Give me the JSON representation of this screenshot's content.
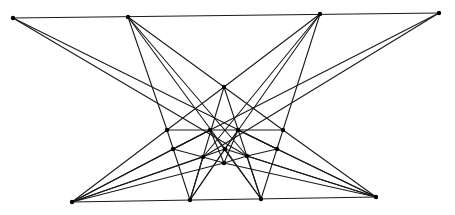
{
  "diagram": {
    "type": "line-configuration",
    "colors": {
      "line": "#1a1a1a",
      "point": "#000000",
      "background": "#ffffff"
    },
    "points": {
      "A": [
        13,
        18
      ],
      "B": [
        128,
        17
      ],
      "C": [
        320,
        14
      ],
      "D": [
        439,
        13
      ],
      "E": [
        72,
        202
      ],
      "F": [
        190,
        200
      ],
      "G": [
        261,
        199
      ],
      "H": [
        376,
        197
      ],
      "T": [
        224,
        87
      ],
      "P1": [
        167,
        130
      ],
      "P2": [
        210,
        130
      ],
      "P3": [
        238,
        130
      ],
      "P4": [
        283,
        130
      ],
      "Q1": [
        173,
        149
      ],
      "Q2": [
        225,
        149
      ],
      "Q3": [
        277,
        149
      ],
      "R1": [
        203,
        157
      ],
      "R2": [
        247,
        156
      ],
      "S": [
        224,
        163
      ]
    },
    "lines": [
      [
        "A",
        "D"
      ],
      [
        "E",
        "H"
      ],
      [
        "A",
        "R2"
      ],
      [
        "R2",
        "H"
      ],
      [
        "A",
        "Q3"
      ],
      [
        "Q3",
        "H"
      ],
      [
        "D",
        "R1"
      ],
      [
        "R1",
        "E"
      ],
      [
        "D",
        "Q1"
      ],
      [
        "Q1",
        "E"
      ],
      [
        "B",
        "P1"
      ],
      [
        "P1",
        "F"
      ],
      [
        "B",
        "Q2"
      ],
      [
        "Q2",
        "G"
      ],
      [
        "B",
        "T"
      ],
      [
        "T",
        "P4"
      ],
      [
        "P4",
        "H"
      ],
      [
        "B",
        "R2"
      ],
      [
        "R2",
        "G"
      ],
      [
        "C",
        "P4"
      ],
      [
        "P4",
        "G"
      ],
      [
        "C",
        "Q2"
      ],
      [
        "Q2",
        "F"
      ],
      [
        "C",
        "T"
      ],
      [
        "T",
        "P1"
      ],
      [
        "P1",
        "E"
      ],
      [
        "C",
        "R1"
      ],
      [
        "R1",
        "F"
      ],
      [
        "T",
        "F"
      ],
      [
        "T",
        "G"
      ],
      [
        "P1",
        "P4"
      ],
      [
        "E",
        "P2"
      ],
      [
        "P2",
        "S"
      ],
      [
        "H",
        "P3"
      ],
      [
        "P3",
        "S"
      ],
      [
        "E",
        "S"
      ],
      [
        "S",
        "H"
      ],
      [
        "Q1",
        "R1"
      ],
      [
        "R1",
        "S"
      ],
      [
        "Q3",
        "R2"
      ],
      [
        "R2",
        "S"
      ],
      [
        "P2",
        "G"
      ],
      [
        "P3",
        "F"
      ],
      [
        "Q1",
        "P2"
      ],
      [
        "Q3",
        "P3"
      ],
      [
        "E",
        "Q2"
      ],
      [
        "Q2",
        "H"
      ]
    ]
  }
}
